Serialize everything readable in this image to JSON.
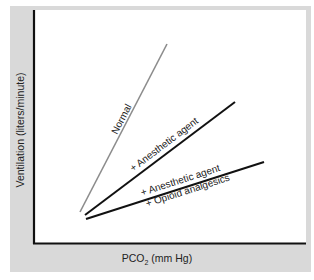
{
  "chart_data": {
    "type": "line",
    "title": "",
    "xlabel": "PCO2 (mm Hg)",
    "xlabel_main": "PCO",
    "xlabel_sub": "2",
    "xlabel_rest": " (mm Hg)",
    "ylabel": "Ventilation (liters/minute)",
    "grid": false,
    "legend": "inline labels along lines",
    "axis_ticks": "none",
    "series": [
      {
        "name": "Normal",
        "color": "#8c8c8c",
        "points_px": [
          [
            80,
            212
          ],
          [
            167,
            44
          ]
        ],
        "relative_slope": "steepest"
      },
      {
        "name": "+ Anesthetic agent",
        "color": "#111111",
        "points_px": [
          [
            85,
            215
          ],
          [
            235,
            102
          ]
        ],
        "relative_slope": "intermediate"
      },
      {
        "name": "+ Anesthetic agent + Opioid analgesics",
        "label_line1": "+ Anesthetic agent",
        "label_line2": "+ Opioid analgesics",
        "color": "#111111",
        "points_px": [
          [
            86,
            219
          ],
          [
            264,
            162
          ]
        ],
        "relative_slope": "shallowest"
      }
    ]
  },
  "colors": {
    "frame": "#d9d9d9",
    "plot_bg": "#ffffff",
    "axis": "#111111"
  }
}
